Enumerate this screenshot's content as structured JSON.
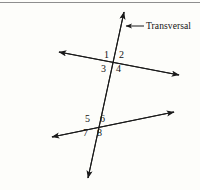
{
  "figure": {
    "background_color": "#fdfdfa",
    "stroke_color": "#1a1a1a",
    "border_color": "#8e8e8e",
    "width": 200,
    "height": 190
  },
  "callout": {
    "label": "Transversal",
    "label_x": 146,
    "label_y": 22,
    "arrow_from_x": 144,
    "arrow_from_y": 26,
    "arrow_to_x": 125,
    "arrow_to_y": 26
  },
  "lines": [
    {
      "name": "transversal",
      "x1": 124,
      "y1": 12,
      "x2": 88,
      "y2": 178,
      "arrow_start": true,
      "arrow_end": true
    },
    {
      "name": "upper-line",
      "x1": 59,
      "y1": 52,
      "x2": 179,
      "y2": 75,
      "arrow_start": true,
      "arrow_end": true
    },
    {
      "name": "lower-line",
      "x1": 52,
      "y1": 137,
      "x2": 174,
      "y2": 112,
      "arrow_start": true,
      "arrow_end": true
    }
  ],
  "intersections": [
    {
      "name": "upper-intersection",
      "x": 115,
      "y": 62
    },
    {
      "name": "lower-intersection",
      "x": 96,
      "y": 126
    }
  ],
  "angle_labels": [
    {
      "id": "angle-1",
      "text": "1",
      "x": 104,
      "y": 50
    },
    {
      "id": "angle-2",
      "text": "2",
      "x": 119,
      "y": 50
    },
    {
      "id": "angle-3",
      "text": "3",
      "x": 101,
      "y": 64
    },
    {
      "id": "angle-4",
      "text": "4",
      "x": 116,
      "y": 64
    },
    {
      "id": "angle-5",
      "text": "5",
      "x": 85,
      "y": 114
    },
    {
      "id": "angle-6",
      "text": "6",
      "x": 100,
      "y": 114
    },
    {
      "id": "angle-7",
      "text": "7",
      "x": 83,
      "y": 128
    },
    {
      "id": "angle-8",
      "text": "8",
      "x": 97,
      "y": 128
    }
  ]
}
